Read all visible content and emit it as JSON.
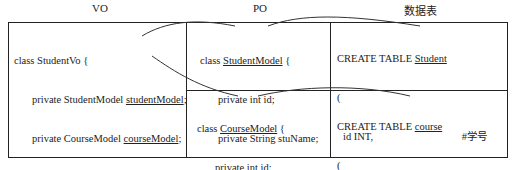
{
  "headers": {
    "vo": "VO",
    "po": "PO",
    "table": "数据表"
  },
  "vo": {
    "line1": "class StudentVo {",
    "line2_prefix": "private StudentModel ",
    "line2_field": "studentModel",
    "line2_suffix": ";",
    "line3_prefix": "private CourseModel ",
    "line3_field": "courseModel",
    "line3_suffix": ";",
    "line4": "......",
    "line5": "}"
  },
  "po_student": {
    "prefix": "class ",
    "name": "StudentModel",
    "suffix": " {",
    "field1": "private int id;",
    "field2": "private String stuName;",
    "close": "}"
  },
  "po_course": {
    "prefix": "class ",
    "name": "CourseModel",
    "suffix": " {",
    "field1": "private int id;",
    "field2": "private String couName;",
    "close": "}"
  },
  "table_student": {
    "prefix": "CREATE TABLE ",
    "name": "Student",
    "open": "(",
    "col1": "id INT,",
    "col1_comment": "#学号",
    "col2": "stuName VARCHAR(20)",
    "col2_comment": "#姓名",
    "close": ")"
  },
  "table_course": {
    "prefix": "CREATE TABLE ",
    "name": "course",
    "open": "(",
    "col1": "id INT,",
    "col1_comment": "#课程编号",
    "col2": "couName VARCHAR(20)",
    "col2_comment": "#课程名称",
    "close": ")"
  }
}
